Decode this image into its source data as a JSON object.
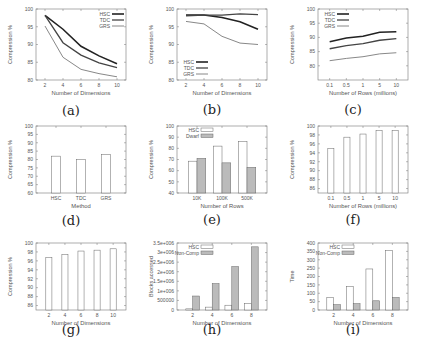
{
  "figure": {
    "panels": [
      {
        "id": "a",
        "caption": "(a)"
      },
      {
        "id": "b",
        "caption": "(b)"
      },
      {
        "id": "c",
        "caption": "(c)"
      },
      {
        "id": "d",
        "caption": "(d)"
      },
      {
        "id": "e",
        "caption": "(e)"
      },
      {
        "id": "f",
        "caption": "(f)"
      },
      {
        "id": "g",
        "caption": "(g)"
      },
      {
        "id": "h",
        "caption": "(h)"
      },
      {
        "id": "i",
        "caption": "(i)"
      }
    ]
  },
  "chart_data": [
    {
      "id": "a",
      "type": "line",
      "title": "",
      "xlabel": "Number of Dimensions",
      "ylabel": "Compression %",
      "x": [
        2,
        4,
        6,
        8,
        10
      ],
      "xticks": [
        "2",
        "4",
        "6",
        "8",
        "10"
      ],
      "yticks": [
        80,
        85,
        90,
        95,
        100
      ],
      "ylim": [
        80,
        100
      ],
      "xlim": [
        1,
        11
      ],
      "legend_position": "top-right",
      "series": [
        {
          "name": "HSC",
          "values": [
            98.2,
            94.3,
            89.5,
            86.8,
            84.6
          ],
          "color": "#222222",
          "width": 1.6
        },
        {
          "name": "TDC",
          "values": [
            98.2,
            90.5,
            87.0,
            84.8,
            83.5
          ],
          "color": "#444444",
          "width": 1.3
        },
        {
          "name": "GRS",
          "values": [
            95.2,
            86.4,
            83.0,
            81.8,
            80.9
          ],
          "color": "#888888",
          "width": 1.0
        }
      ]
    },
    {
      "id": "b",
      "type": "line",
      "title": "",
      "xlabel": "Number of Dimensions",
      "ylabel": "Compression %",
      "x": [
        2,
        4,
        6,
        8,
        10
      ],
      "xticks": [
        "2",
        "4",
        "6",
        "8",
        "10"
      ],
      "yticks": [
        80,
        85,
        90,
        95,
        100
      ],
      "ylim": [
        80,
        100
      ],
      "xlim": [
        1,
        11
      ],
      "legend_position": "bottom-left",
      "series": [
        {
          "name": "HSC",
          "values": [
            98.3,
            98.3,
            97.6,
            96.4,
            94.3
          ],
          "color": "#222222",
          "width": 1.6
        },
        {
          "name": "TDC",
          "values": [
            98.1,
            98.3,
            98.3,
            98.6,
            98.4
          ],
          "color": "#444444",
          "width": 1.3
        },
        {
          "name": "GRS",
          "values": [
            96.5,
            95.8,
            92.3,
            90.4,
            90.0
          ],
          "color": "#888888",
          "width": 1.0
        }
      ]
    },
    {
      "id": "c",
      "type": "line",
      "title": "",
      "xlabel": "Number of Rows (millions)",
      "ylabel": "Compression %",
      "x": [
        0.1,
        0.5,
        1,
        5,
        10
      ],
      "xticks": [
        "0.1",
        "0.5",
        "1",
        "5",
        "10"
      ],
      "yticks": [
        80,
        85,
        90,
        95,
        100
      ],
      "ylim": [
        75,
        100
      ],
      "legend_position": "top-left",
      "series": [
        {
          "name": "HSC",
          "values": [
            88.5,
            89.8,
            90.4,
            91.8,
            92.0
          ],
          "color": "#222222",
          "width": 1.6
        },
        {
          "name": "TDC",
          "values": [
            86.0,
            87.1,
            87.8,
            89.0,
            89.6
          ],
          "color": "#444444",
          "width": 1.3
        },
        {
          "name": "GRS",
          "values": [
            81.8,
            82.6,
            83.2,
            84.2,
            84.6
          ],
          "color": "#888888",
          "width": 1.0
        }
      ]
    },
    {
      "id": "d",
      "type": "bar",
      "title": "",
      "xlabel": "Method",
      "ylabel": "Compression %",
      "categories": [
        "HSC",
        "TDC",
        "GRS"
      ],
      "values": [
        82,
        80,
        83
      ],
      "yticks": [
        60,
        65,
        70,
        75,
        80,
        85,
        90,
        95,
        100
      ],
      "ylim": [
        60,
        100
      ]
    },
    {
      "id": "e",
      "type": "bar",
      "title": "",
      "xlabel": "Number of Rows",
      "ylabel": "Compression %",
      "categories": [
        "10K",
        "100K",
        "500K"
      ],
      "yticks": [
        40,
        50,
        60,
        70,
        80,
        90,
        100
      ],
      "ylim": [
        40,
        100
      ],
      "legend_position": "top-left",
      "series": [
        {
          "name": "HSC",
          "values": [
            68.5,
            82,
            86
          ],
          "fill": "#ffffff"
        },
        {
          "name": "Dwarf",
          "values": [
            71,
            67,
            63
          ],
          "fill": "#bbbbbb"
        }
      ]
    },
    {
      "id": "f",
      "type": "bar",
      "title": "",
      "xlabel": "Number of Rows (millions)",
      "ylabel": "Compression %",
      "categories": [
        "0.1",
        "0.5",
        "1",
        "5",
        "10"
      ],
      "values": [
        95,
        97.5,
        98.2,
        99,
        99
      ],
      "yticks": [
        86,
        88,
        90,
        92,
        94,
        96,
        98,
        100
      ],
      "ylim": [
        85,
        100
      ]
    },
    {
      "id": "g",
      "type": "bar",
      "title": "",
      "xlabel": "Number of Dimensions",
      "ylabel": "Compression %",
      "categories": [
        "2",
        "4",
        "6",
        "8",
        "10"
      ],
      "values": [
        96.8,
        97.4,
        98.2,
        98.4,
        98.7
      ],
      "yticks": [
        86,
        88,
        90,
        92,
        94,
        96,
        98,
        100
      ],
      "ylim": [
        85,
        100
      ]
    },
    {
      "id": "h",
      "type": "bar",
      "title": "",
      "xlabel": "Number of Dimensions",
      "ylabel": "Blocks accessed",
      "categories": [
        "2",
        "4",
        "6",
        "8"
      ],
      "yticks": [
        0,
        500000,
        1000000,
        1500000,
        2000000,
        2500000,
        3000000,
        3500000
      ],
      "yticklabels": [
        "0",
        "500000",
        "1e+006",
        "1.5e+006",
        "2e+006",
        "2.5e+006",
        "3e+006",
        "3.5e+006"
      ],
      "ylim": [
        0,
        3500000
      ],
      "legend_position": "top-left",
      "series": [
        {
          "name": "HSC",
          "values": [
            60000,
            150000,
            250000,
            350000
          ],
          "fill": "#ffffff"
        },
        {
          "name": "Non-Comp",
          "values": [
            730000,
            1380000,
            2270000,
            3300000
          ],
          "fill": "#bbbbbb"
        }
      ]
    },
    {
      "id": "i",
      "type": "bar",
      "title": "",
      "xlabel": "Number of Dimensions",
      "ylabel": "Time",
      "categories": [
        "2",
        "4",
        "6",
        "8"
      ],
      "yticks": [
        0,
        50,
        100,
        150,
        200,
        250,
        300,
        350,
        400
      ],
      "ylim": [
        0,
        400
      ],
      "legend_position": "top-left",
      "series": [
        {
          "name": "HSC",
          "values": [
            75,
            140,
            245,
            355
          ],
          "fill": "#ffffff"
        },
        {
          "name": "Non-Comp",
          "values": [
            32,
            38,
            55,
            75
          ],
          "fill": "#bbbbbb"
        }
      ]
    }
  ]
}
